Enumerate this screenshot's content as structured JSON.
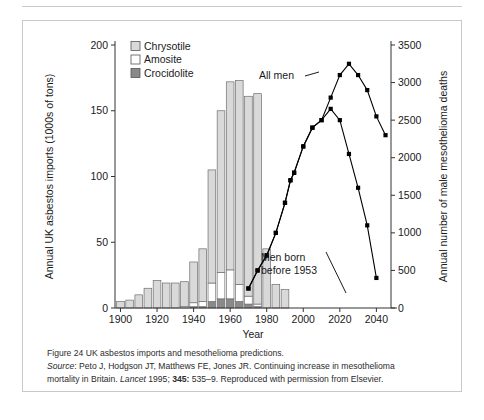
{
  "figure": {
    "caption_label": "Figure 24",
    "caption_title": "UK asbestos imports and mesothelioma predictions.",
    "source_label": "Source",
    "source_authors": ": Peto J, Hodgson JT, Matthews FE, Jones JR. Continuing increase in mesothelioma",
    "source_line2_a": "mortality in Britain. ",
    "source_journal": "Lancet",
    "source_line2_b": " 1995; ",
    "source_volume": "345:",
    "source_line2_c": " 535–9. Reproduced with permission from Elsevier."
  },
  "chart_data": {
    "type": "bar",
    "title": "",
    "xlabel": "Year",
    "ylabel": "Annual UK asbestos imports (1000s of tons)",
    "y2label": "Annual number of male mesothelioma deaths",
    "xlim": [
      1897,
      2048
    ],
    "ylim": [
      0,
      200
    ],
    "y2lim": [
      0,
      3500
    ],
    "xticks": [
      1900,
      1920,
      1940,
      1960,
      1980,
      2000,
      2020,
      2040
    ],
    "xticklabels": [
      "1900",
      "1920",
      "1940",
      "1960",
      "1980",
      "2000",
      "2020",
      "2040"
    ],
    "yticks": [
      0,
      50,
      100,
      150,
      200
    ],
    "yticklabels": [
      "0",
      "50",
      "100",
      "150",
      "200"
    ],
    "y2ticks": [
      0,
      500,
      1000,
      1500,
      2000,
      2500,
      3000,
      3500
    ],
    "y2ticklabels": [
      "0",
      "500",
      "1000",
      "1500",
      "2000",
      "2500",
      "3000",
      "3500"
    ],
    "grid": false,
    "legend_position": "upper-left",
    "legend": [
      {
        "label": "Chrysotile",
        "color": "#d9d9d9"
      },
      {
        "label": "Amosite",
        "color": "#ffffff"
      },
      {
        "label": "Crocidolite",
        "color": "#8a8a8a"
      }
    ],
    "bar_width_years": 4.2,
    "bars": {
      "years": [
        1900,
        1905,
        1910,
        1915,
        1920,
        1925,
        1930,
        1935,
        1940,
        1945,
        1950,
        1955,
        1960,
        1965,
        1970,
        1975,
        1980,
        1985,
        1990
      ],
      "series": [
        {
          "name": "Crocidolite",
          "color": "#8a8a8a",
          "values": [
            0,
            0,
            0,
            0,
            0,
            0,
            0,
            0,
            1,
            1,
            5,
            7,
            7,
            5,
            3,
            1,
            0,
            0,
            0
          ]
        },
        {
          "name": "Amosite",
          "color": "#ffffff",
          "values": [
            0,
            0,
            0,
            0,
            0,
            0,
            0,
            1,
            3,
            4,
            14,
            20,
            22,
            13,
            6,
            2,
            0,
            0,
            0
          ]
        },
        {
          "name": "Chrysotile",
          "color": "#d9d9d9",
          "values": [
            5,
            6,
            10,
            15,
            21,
            19,
            19,
            19,
            31,
            40,
            86,
            123,
            143,
            155,
            152,
            160,
            45,
            18,
            14
          ]
        }
      ],
      "totals": [
        5,
        6,
        10,
        15,
        21,
        19,
        19,
        20,
        35,
        45,
        105,
        150,
        172,
        173,
        161,
        163,
        45,
        18,
        14
      ]
    },
    "lines": [
      {
        "name": "All men",
        "annotation": "All men",
        "marker": "square",
        "color": "#000000",
        "x": [
          1970,
          1975,
          1980,
          1985,
          1990,
          1993,
          1995,
          2000,
          2005,
          2010,
          2015,
          2020,
          2025,
          2030,
          2035,
          2040,
          2045
        ],
        "y": [
          260,
          500,
          700,
          1000,
          1400,
          1700,
          1800,
          2150,
          2400,
          2500,
          2800,
          3100,
          3250,
          3100,
          2900,
          2550,
          2300
        ]
      },
      {
        "name": "Men born before 1953",
        "annotation": "Men born before 1953",
        "marker": "square",
        "color": "#000000",
        "x": [
          1970,
          1975,
          1980,
          1985,
          1990,
          1993,
          1995,
          2000,
          2005,
          2010,
          2015,
          2020,
          2025,
          2030,
          2035,
          2040
        ],
        "y": [
          260,
          500,
          700,
          1000,
          1400,
          1700,
          1800,
          2150,
          2400,
          2500,
          2650,
          2500,
          2050,
          1600,
          1100,
          400
        ]
      }
    ]
  }
}
